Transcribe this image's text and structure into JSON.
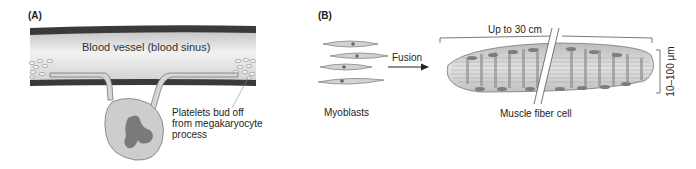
{
  "panel_a": {
    "label": "(A)",
    "vessel_label": "Blood vessel (blood sinus)",
    "callout_lines": [
      "Platelets bud off",
      "from megakaryocyte",
      "process"
    ]
  },
  "panel_b": {
    "label": "(B)",
    "myoblasts_label": "Myoblasts",
    "arrow_label": "Fusion",
    "length_label": "Up to 30 cm",
    "fiber_label": "Muscle fiber cell",
    "width_label": "10–100 μm"
  },
  "colors": {
    "vessel_wall": "#3a3a3a",
    "vessel_fill": "#d9d9d9",
    "cell_fill": "#cfcfcf",
    "nucleus": "#7a7a7a",
    "outline": "#6e6e6e"
  }
}
